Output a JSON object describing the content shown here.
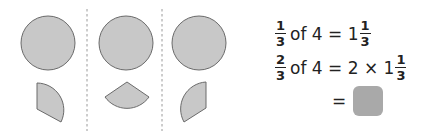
{
  "diagram": {
    "divider_count": 2,
    "shape_fill": "#c8c8c8",
    "shape_stroke": "#6a6a6a",
    "divider_color": "#9a9a9a",
    "panels": [
      {
        "shape": "circle",
        "piece": "sector-right"
      },
      {
        "shape": "circle",
        "piece": "sector-bottom"
      },
      {
        "shape": "circle",
        "piece": "sector-left"
      }
    ]
  },
  "equations": {
    "line1": {
      "frac_num": "1",
      "frac_den": "3",
      "text": "of 4 = 1",
      "mixed_num": "1",
      "mixed_den": "3"
    },
    "line2": {
      "frac_num": "2",
      "frac_den": "3",
      "text": "of 4 = 2 × 1",
      "mixed_num": "1",
      "mixed_den": "3"
    },
    "line3": {
      "text": "=",
      "answer_box_color": "#a9a9a9"
    }
  }
}
